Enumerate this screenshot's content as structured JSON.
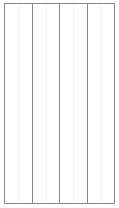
{
  "diagram": {
    "type": "column-grid",
    "column_count": 4,
    "border_color": "#8a8a8a",
    "guide_color": "#f0f0f0",
    "columns": [
      {
        "label": ""
      },
      {
        "label": ""
      },
      {
        "label": ""
      },
      {
        "label": ""
      }
    ]
  }
}
